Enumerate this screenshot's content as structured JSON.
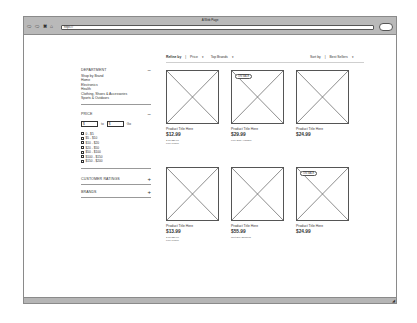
{
  "window": {
    "title": "A Web Page",
    "url": "https://",
    "nav_buttons": [
      "back",
      "forward",
      "stop",
      "home"
    ]
  },
  "toolbar": {
    "refine_label": "Refine by",
    "refine_sep": "|",
    "price_filter": "Price",
    "top_brands_filter": "Top Brands",
    "sort_label": "Sort by",
    "sort_sep": "|",
    "sort_value": "Best Sellers"
  },
  "sidebar": {
    "department": {
      "title": "DEPARTMENT",
      "toggle": "−",
      "items": [
        "Shop by Brand",
        "Home",
        "Electronics",
        "Health",
        "Clothing, Shoes & Accessories",
        "Sports & Outdoors"
      ]
    },
    "price": {
      "title": "PRICE",
      "toggle": "−",
      "min_value": "$",
      "max_value": "$",
      "to_label": "to",
      "go_label": "Go",
      "ranges": [
        "0 - $5",
        "$5 - $10",
        "$10 - $20",
        "$20 - $50",
        "$50 - $100",
        "$100 - $150",
        "$150 - $200"
      ]
    },
    "customer_ratings": {
      "title": "CUSTOMER RATINGS",
      "toggle": "+"
    },
    "brands": {
      "title": "BRANDS",
      "toggle": "+"
    }
  },
  "products": [
    {
      "title": "Product Title Here",
      "price": "$12.99",
      "badge": "",
      "meta": [
        "2 for $20.00",
        "Free Pickup"
      ]
    },
    {
      "title": "Product Title Here",
      "price": "$29.99",
      "badge": "ON SALE",
      "meta": [
        "Free Ship Available"
      ]
    },
    {
      "title": "Product Title Here",
      "price": "$24.99",
      "badge": "",
      "meta": []
    },
    {
      "title": "Product Title Here",
      "price": "$13.99",
      "badge": "",
      "meta": [
        "2 for $20.00",
        "Free Pickup"
      ]
    },
    {
      "title": "Product Title Here",
      "price": "$55.99",
      "badge": "",
      "meta": [
        "Next Day Shipping"
      ]
    },
    {
      "title": "Product Title Here",
      "price": "$24.99",
      "badge": "ON SALE",
      "meta": []
    }
  ]
}
